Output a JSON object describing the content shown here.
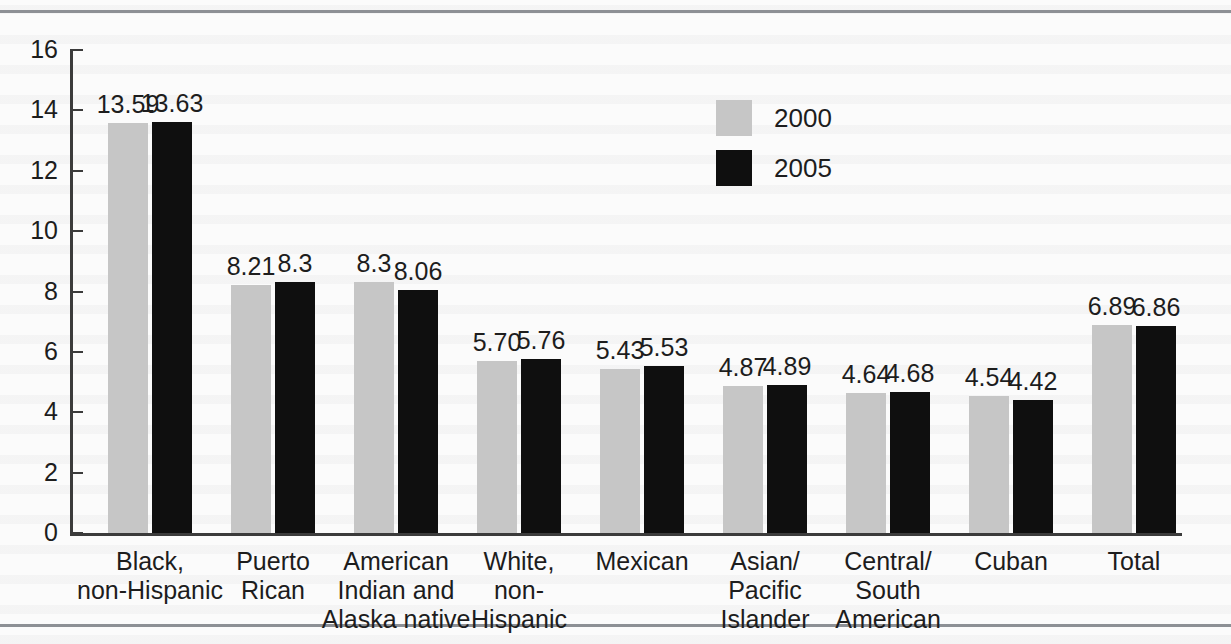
{
  "chart_data": {
    "type": "bar",
    "title": "",
    "xlabel": "",
    "ylabel": "",
    "ylim": [
      0,
      16
    ],
    "ytick_values": [
      0,
      2,
      4,
      6,
      8,
      10,
      12,
      14,
      16
    ],
    "ytick_labels": [
      "0",
      "2",
      "4",
      "6",
      "8",
      "10",
      "12",
      "14",
      "16"
    ],
    "grid": false,
    "legend_position": "upper-center",
    "categories": [
      "Black,\nnon-Hispanic",
      "Puerto\nRican",
      "American\nIndian and\nAlaska native",
      "White,\nnon-\nHispanic",
      "Mexican",
      "Asian/\nPacific\nIslander",
      "Central/\nSouth\nAmerican",
      "Cuban",
      "Total"
    ],
    "series": [
      {
        "name": "2000",
        "color": "#c6c6c6",
        "values": [
          13.59,
          8.21,
          8.3,
          5.7,
          5.43,
          4.87,
          4.64,
          4.54,
          6.89
        ],
        "labels": [
          "13.59",
          "8.21",
          "8.3",
          "5.70",
          "5.43",
          "4.87",
          "4.64",
          "4.54",
          "6.89"
        ]
      },
      {
        "name": "2005",
        "color": "#0f0f0f",
        "values": [
          13.63,
          8.3,
          8.06,
          5.76,
          5.53,
          4.89,
          4.68,
          4.42,
          6.86
        ],
        "labels": [
          "13.63",
          "8.3",
          "8.06",
          "5.76",
          "5.53",
          "4.89",
          "4.68",
          "4.42",
          "6.86"
        ]
      }
    ]
  },
  "legend": {
    "entries": [
      {
        "label": "2000",
        "color": "#c6c6c6"
      },
      {
        "label": "2005",
        "color": "#0f0f0f"
      }
    ]
  }
}
